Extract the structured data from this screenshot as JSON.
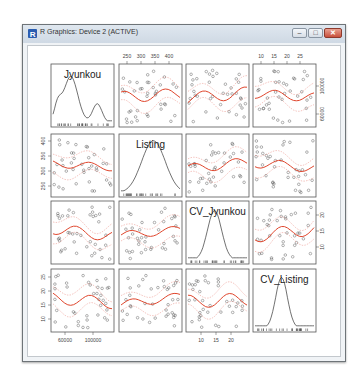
{
  "window": {
    "title": "R Graphics: Device 2 (ACTIVE)",
    "buttons": {
      "minimize": "–",
      "maximize": "□",
      "close": "✕"
    }
  },
  "plot": {
    "type": "scatterplot-matrix",
    "variables": [
      "Jyunkou",
      "Listing",
      "CV_Jyunkou",
      "CV_Listing"
    ],
    "top_axis": {
      "col2": [
        "250",
        "300",
        "350",
        "400"
      ],
      "col4": [
        "10",
        "15",
        "20",
        "25"
      ]
    },
    "right_axis": {
      "row1": [
        "60000",
        "100000"
      ],
      "row3": [
        "10",
        "15",
        "20"
      ]
    },
    "left_axis": {
      "row2": [
        "250",
        "300",
        "350",
        "400"
      ],
      "row4": [
        "10",
        "15",
        "20",
        "25"
      ]
    },
    "bottom_axis": {
      "col1": [
        "60000",
        "100000"
      ],
      "col3": [
        "10",
        "15",
        "20"
      ]
    },
    "colors": {
      "smooth": "#e0462d",
      "spread": "#e88a80",
      "points": "#555555",
      "frame": "#555555"
    }
  }
}
